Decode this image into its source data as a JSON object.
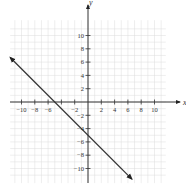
{
  "chart_data": {
    "type": "line",
    "title": "",
    "xlabel": "x",
    "ylabel": "y",
    "xlim": [
      -12,
      12
    ],
    "ylim": [
      -12,
      12
    ],
    "grid": true,
    "x_ticks": [
      -10,
      -8,
      -6,
      -4,
      -2,
      2,
      4,
      6,
      8,
      10
    ],
    "x_tick_labels": [
      "−10",
      "−8",
      "−6",
      "−2",
      "2",
      "4",
      "6",
      "8",
      "10"
    ],
    "y_ticks": [
      10,
      8,
      6,
      4,
      2,
      -2,
      -4,
      -6,
      -8,
      -10
    ],
    "y_tick_labels": [
      "10",
      "8",
      "6",
      "4",
      "2",
      "−2",
      "−4",
      "−6",
      "−8",
      "−10"
    ],
    "series": [
      {
        "name": "y = -x - 5",
        "x": [
          -11.7,
          -5,
          0,
          6.6
        ],
        "y": [
          6.7,
          0,
          -5,
          -11.6
        ],
        "slope": -1,
        "intercept": -5,
        "arrows": "both"
      }
    ],
    "colors": {
      "line": "#333333",
      "axis": "#333333",
      "grid": "#dcdcdc"
    }
  }
}
